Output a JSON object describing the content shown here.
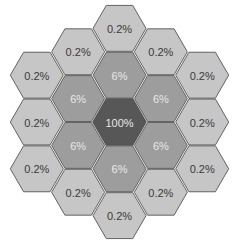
{
  "diagram": {
    "colors": {
      "outer": "#c6c6c6",
      "middle": "#9d9d9d",
      "center": "#575757",
      "stroke": "#555555",
      "outer_text": "#3a3a3a",
      "inner_text": "#e8e8e8"
    },
    "cells": [
      {
        "q": 0,
        "r": -2,
        "label": "0.2%",
        "ring": "outer"
      },
      {
        "q": -1,
        "r": -1.5,
        "label": "0.2%",
        "ring": "outer"
      },
      {
        "q": 1,
        "r": -1.5,
        "label": "0.2%",
        "ring": "outer"
      },
      {
        "q": -2,
        "r": -1,
        "label": "0.2%",
        "ring": "outer"
      },
      {
        "q": 0,
        "r": -1,
        "label": "6%",
        "ring": "middle"
      },
      {
        "q": 2,
        "r": -1,
        "label": "0.2%",
        "ring": "outer"
      },
      {
        "q": -1,
        "r": -0.5,
        "label": "6%",
        "ring": "middle"
      },
      {
        "q": 1,
        "r": -0.5,
        "label": "6%",
        "ring": "middle"
      },
      {
        "q": -2,
        "r": 0,
        "label": "0.2%",
        "ring": "outer"
      },
      {
        "q": 0,
        "r": 0,
        "label": "100%",
        "ring": "center"
      },
      {
        "q": 2,
        "r": 0,
        "label": "0.2%",
        "ring": "outer"
      },
      {
        "q": -1,
        "r": 0.5,
        "label": "6%",
        "ring": "middle"
      },
      {
        "q": 1,
        "r": 0.5,
        "label": "6%",
        "ring": "middle"
      },
      {
        "q": -2,
        "r": 1,
        "label": "0.2%",
        "ring": "outer"
      },
      {
        "q": 0,
        "r": 1,
        "label": "6%",
        "ring": "middle"
      },
      {
        "q": 2,
        "r": 1,
        "label": "0.2%",
        "ring": "outer"
      },
      {
        "q": -1,
        "r": 1.5,
        "label": "0.2%",
        "ring": "outer"
      },
      {
        "q": 1,
        "r": 1.5,
        "label": "0.2%",
        "ring": "outer"
      },
      {
        "q": 0,
        "r": 2,
        "label": "0.2%",
        "ring": "outer"
      }
    ]
  }
}
